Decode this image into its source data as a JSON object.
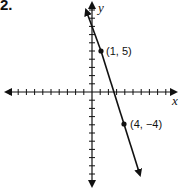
{
  "problem": {
    "number": "2."
  },
  "chart_data": {
    "type": "line",
    "title": "",
    "xlabel": "x",
    "ylabel": "y",
    "xlim": [
      -11,
      10
    ],
    "ylim": [
      -11,
      11
    ],
    "grid": false,
    "ticks_every": 1,
    "series": [
      {
        "name": "line",
        "points": [
          [
            1,
            5
          ],
          [
            4,
            -4
          ]
        ],
        "slope": -3,
        "intercept": 8,
        "arrows_both_ends": true
      }
    ],
    "annotations": [
      {
        "text": "(1, 5)",
        "x": 1,
        "y": 5
      },
      {
        "text": "(4, −4)",
        "x": 4,
        "y": -4
      }
    ]
  },
  "labels": {
    "x_axis": "x",
    "y_axis": "y",
    "point1": "(1, 5)",
    "point2": "(4, −4)"
  },
  "colors": {
    "ink": "#111111",
    "background": "#ffffff"
  }
}
